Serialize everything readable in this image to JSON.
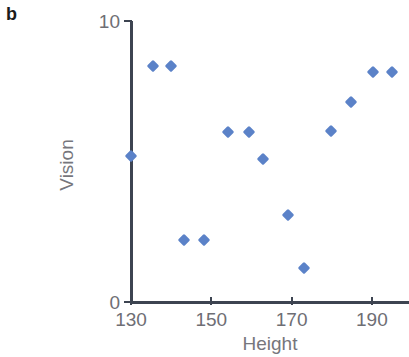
{
  "panel": {
    "label": "b"
  },
  "chart_data": {
    "type": "scatter",
    "title": "",
    "xlabel": "Height",
    "ylabel": "Vision",
    "xlim": [
      130,
      199
    ],
    "ylim": [
      0,
      10
    ],
    "xticks": [
      130,
      150,
      170,
      190
    ],
    "xtick_labels": [
      "130",
      "150",
      "170",
      "190"
    ],
    "yticks": [
      0,
      10
    ],
    "ytick_labels": [
      "0",
      "10"
    ],
    "grid": false,
    "legend": null,
    "marker": {
      "shape": "diamond",
      "color": "#5b82c8",
      "size": 9
    },
    "series": [
      {
        "name": "Vision vs Height",
        "color": "#5b82c8",
        "points": [
          {
            "x": 130.0,
            "y": 5.2
          },
          {
            "x": 135.6,
            "y": 8.4
          },
          {
            "x": 140.0,
            "y": 8.4
          },
          {
            "x": 143.2,
            "y": 2.2
          },
          {
            "x": 148.2,
            "y": 2.2
          },
          {
            "x": 154.2,
            "y": 6.05
          },
          {
            "x": 159.4,
            "y": 6.05
          },
          {
            "x": 162.9,
            "y": 5.1
          },
          {
            "x": 169.1,
            "y": 3.1
          },
          {
            "x": 173.1,
            "y": 1.2
          },
          {
            "x": 179.8,
            "y": 6.1
          },
          {
            "x": 184.7,
            "y": 7.1
          },
          {
            "x": 190.3,
            "y": 8.2
          },
          {
            "x": 194.9,
            "y": 8.2
          }
        ]
      }
    ]
  },
  "axis_colors": {
    "axis_line": "#3d4451",
    "tick_label": "#6e6e74",
    "axis_title": "#76767c",
    "panel_label": "#1b1b1b"
  }
}
